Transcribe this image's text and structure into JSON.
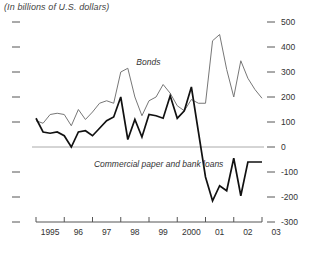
{
  "chart_data": {
    "type": "line",
    "title": "(In billions of U.S. dollars)",
    "xlabel": "",
    "ylabel": "",
    "ylim": [
      -300,
      500
    ],
    "yticks": [
      500,
      400,
      300,
      200,
      100,
      0,
      -100,
      -200,
      -300
    ],
    "ytick_labels": [
      "500",
      "400",
      "300",
      "200",
      "100",
      "0",
      "-100",
      "-200",
      "-300"
    ],
    "y_axis_position": "right",
    "left_axis_ticks_unlabeled": true,
    "grid": false,
    "zero_line": true,
    "legend_position": "inline-annotation",
    "xlim": [
      1995.0,
      2003.0
    ],
    "xtick_labels": [
      "1995",
      "96",
      "97",
      "98",
      "99",
      "2000",
      "01",
      "02",
      "03"
    ],
    "xtick_values": [
      1995,
      1996,
      1997,
      1998,
      1999,
      2000,
      2001,
      2002,
      2003
    ],
    "x_frequency": "quarterly",
    "series": [
      {
        "name": "Bonds",
        "color": "#777777",
        "label_x": 1998.55,
        "label_y": 330,
        "x": [
          1995.0,
          1995.25,
          1995.5,
          1995.75,
          1996.0,
          1996.25,
          1996.5,
          1996.75,
          1997.0,
          1997.25,
          1997.5,
          1997.75,
          1998.0,
          1998.25,
          1998.5,
          1998.75,
          1999.0,
          1999.25,
          1999.5,
          1999.75,
          2000.0,
          2000.25,
          2000.5,
          2000.75,
          2001.0,
          2001.25,
          2001.5,
          2001.75,
          2002.0,
          2002.25,
          2002.5,
          2002.75,
          2003.0
        ],
        "values": [
          105,
          95,
          130,
          135,
          130,
          85,
          150,
          110,
          140,
          175,
          185,
          175,
          300,
          315,
          200,
          125,
          185,
          200,
          250,
          215,
          165,
          145,
          190,
          175,
          175,
          425,
          450,
          310,
          200,
          345,
          275,
          230,
          195
        ]
      },
      {
        "name": "Commercial paper and bank loans",
        "color": "#111111",
        "label_x": 1997.05,
        "label_y": -80,
        "x": [
          1995.0,
          1995.25,
          1995.5,
          1995.75,
          1996.0,
          1996.25,
          1996.5,
          1996.75,
          1997.0,
          1997.25,
          1997.5,
          1997.75,
          1998.0,
          1998.25,
          1998.5,
          1998.75,
          1999.0,
          1999.25,
          1999.5,
          1999.75,
          2000.0,
          2000.25,
          2000.5,
          2000.75,
          2001.0,
          2001.25,
          2001.5,
          2001.75,
          2002.0,
          2002.25,
          2002.5,
          2002.75,
          2003.0
        ],
        "values": [
          115,
          60,
          55,
          60,
          45,
          0,
          60,
          65,
          45,
          75,
          105,
          120,
          200,
          30,
          110,
          40,
          130,
          125,
          115,
          205,
          115,
          145,
          240,
          60,
          -120,
          -215,
          -155,
          -175,
          -45,
          -195,
          -60,
          -60,
          -60
        ]
      }
    ]
  },
  "plot_geometry": {
    "left": 36,
    "right": 262,
    "top": 22,
    "bottom": 222,
    "y_top_value": 500,
    "y_bottom_value": -300
  }
}
